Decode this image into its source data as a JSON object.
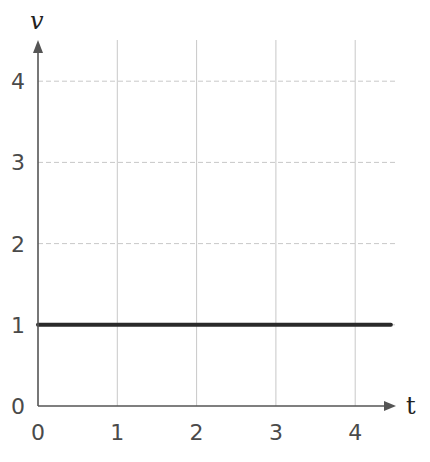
{
  "chart_data": {
    "type": "line",
    "title": "",
    "xlabel": "t",
    "ylabel": "v",
    "x_ticks": [
      "0",
      "1",
      "2",
      "3",
      "4"
    ],
    "y_ticks": [
      "0",
      "1",
      "2",
      "3",
      "4"
    ],
    "xlim": [
      0,
      4.5
    ],
    "ylim": [
      0,
      4.5
    ],
    "grid": true,
    "legend": null,
    "series": [
      {
        "name": "v(t)",
        "x": [
          0,
          4.5
        ],
        "y": [
          1,
          1
        ],
        "color": "#2a2a2a"
      }
    ]
  },
  "colors": {
    "axis": "#555555",
    "grid": "#c8c8c8",
    "line": "#2a2a2a"
  }
}
